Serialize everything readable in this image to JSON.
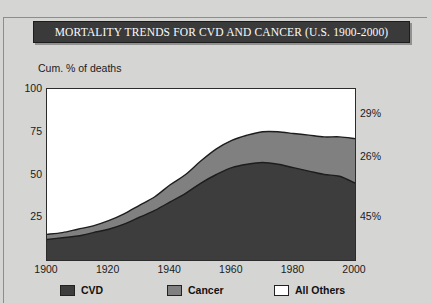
{
  "title": "MORTALITY TRENDS FOR CVD AND CANCER (U.S. 1900-2000)",
  "caption": "Cardiovascular disease (CVD) and cancer (as a percentage of all",
  "colors": {
    "cvd": "#3d3d3d",
    "cancer": "#808080",
    "all_others": "#ffffff",
    "background": "#d5d5d3",
    "title_bar": "#3a3a3a",
    "axis": "#2c2c2c",
    "text": "#1b1b1b"
  },
  "legend": {
    "items": [
      {
        "label": "CVD",
        "color": "#3d3d3d"
      },
      {
        "label": "Cancer",
        "color": "#808080"
      },
      {
        "label": "All Others",
        "color": "#ffffff"
      }
    ]
  },
  "right_annotations": [
    {
      "label": "29%",
      "value": 85.5
    },
    {
      "label": "26%",
      "value": 60.0
    },
    {
      "label": "45%",
      "value": 25.0
    }
  ],
  "chart_data": {
    "type": "area",
    "title": "MORTALITY TRENDS FOR CVD AND CANCER (U.S. 1900-2000)",
    "xlabel": "",
    "ylabel": "Cum. % of deaths",
    "xlim": [
      1900,
      2000
    ],
    "ylim": [
      0,
      100
    ],
    "yticks": [
      25,
      50,
      75,
      100
    ],
    "xticks": [
      1900,
      1920,
      1940,
      1960,
      1980,
      2000
    ],
    "grid": false,
    "legend_position": "bottom",
    "stacked": true,
    "x": [
      1900,
      1905,
      1910,
      1915,
      1920,
      1925,
      1930,
      1935,
      1940,
      1945,
      1950,
      1955,
      1960,
      1965,
      1970,
      1975,
      1980,
      1985,
      1990,
      1995,
      2000
    ],
    "series": [
      {
        "name": "CVD",
        "color": "#3d3d3d",
        "values": [
          12,
          13,
          14,
          16,
          18,
          21,
          25,
          29,
          34,
          39,
          45,
          50,
          54,
          56,
          57,
          56,
          54,
          52,
          50,
          49,
          45
        ]
      },
      {
        "name": "Cancer",
        "color": "#808080",
        "values": [
          3,
          3,
          4,
          4,
          5,
          6,
          7,
          8,
          10,
          11,
          13,
          15,
          16,
          17,
          18,
          19,
          20,
          21,
          22,
          23,
          26
        ]
      },
      {
        "name": "All Others",
        "color": "#ffffff",
        "values": [
          85,
          84,
          82,
          80,
          77,
          73,
          68,
          63,
          56,
          50,
          42,
          35,
          30,
          27,
          25,
          25,
          26,
          27,
          28,
          28,
          29
        ]
      }
    ],
    "cumulative_totals": [
      15,
      16,
      18,
      20,
      23,
      27,
      32,
      37,
      44,
      50,
      58,
      65,
      70,
      73,
      75,
      75,
      74,
      73,
      72,
      72,
      71
    ],
    "final_year_breakdown": {
      "year": 2000,
      "CVD": 45,
      "Cancer": 26,
      "All Others": 29
    }
  }
}
